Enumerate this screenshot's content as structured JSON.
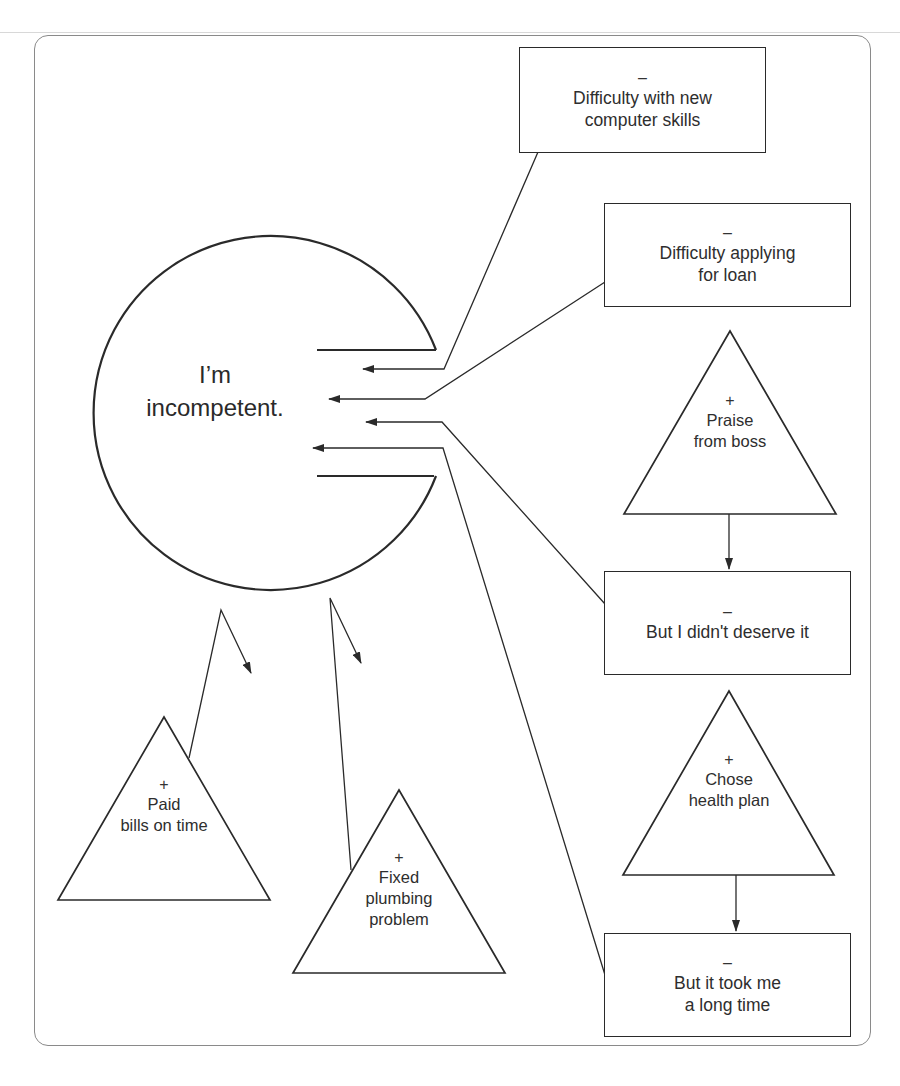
{
  "diagram": {
    "type": "cognitive-filter-diagram",
    "colors": {
      "stroke": "#2a2a2a",
      "frame": "#8a8a8a",
      "background": "#ffffff"
    },
    "core_belief": {
      "line1": "I’m",
      "line2": "incompetent."
    },
    "negative_items": [
      {
        "id": "n1",
        "sign": "–",
        "line1": "Difficulty with new",
        "line2": "computer skills",
        "enters_filter": true
      },
      {
        "id": "n2",
        "sign": "–",
        "line1": "Difficulty applying",
        "line2": "for loan",
        "enters_filter": true
      },
      {
        "id": "n3",
        "sign": "–",
        "line1": "But I didn't deserve it",
        "line2": "",
        "enters_filter": true
      },
      {
        "id": "n4",
        "sign": "–",
        "line1": "But it took me",
        "line2": "a long time",
        "enters_filter": true
      }
    ],
    "positive_items": [
      {
        "id": "p1",
        "sign": "+",
        "line1": "Praise",
        "line2": "from boss",
        "transformed_into": "n3"
      },
      {
        "id": "p2",
        "sign": "+",
        "line1": "Chose",
        "line2": "health plan",
        "transformed_into": "n4"
      },
      {
        "id": "p3",
        "sign": "+",
        "line1": "Paid",
        "line2": "bills on time",
        "deflected": true
      },
      {
        "id": "p4",
        "sign": "+",
        "line1": "Fixed",
        "line2": "plumbing",
        "line3": "problem",
        "deflected": true
      }
    ]
  }
}
